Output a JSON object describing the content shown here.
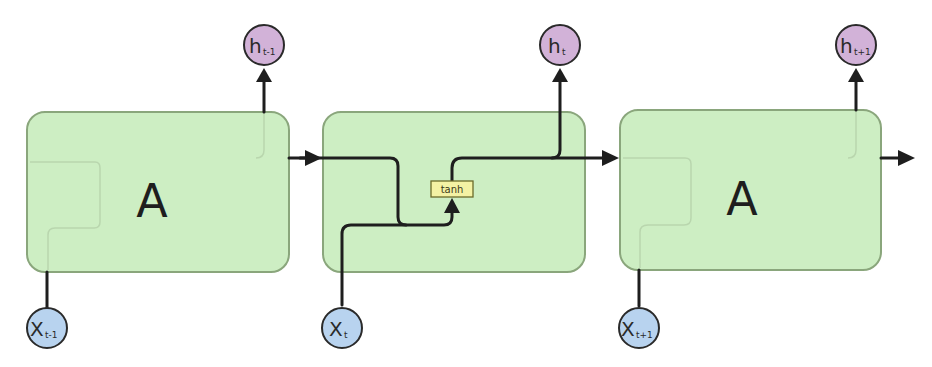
{
  "diagram": {
    "colors": {
      "cell_fill": "#cdeec3",
      "cell_stroke": "#8aa67c",
      "wire": "#1e1e1e",
      "output_node": "#d2b2d8",
      "input_node": "#b8d3ef",
      "activation_fill": "#f4f2a4"
    },
    "cells": [
      {
        "label": "A"
      },
      {
        "label": "",
        "activation": "tanh"
      },
      {
        "label": "A"
      }
    ],
    "outputs": [
      {
        "main": "h",
        "sub": "t-1"
      },
      {
        "main": "h",
        "sub": "t"
      },
      {
        "main": "h",
        "sub": "t+1"
      }
    ],
    "inputs": [
      {
        "main": "X",
        "sub": "t-1"
      },
      {
        "main": "X",
        "sub": "t"
      },
      {
        "main": "X",
        "sub": "t+1"
      }
    ]
  }
}
